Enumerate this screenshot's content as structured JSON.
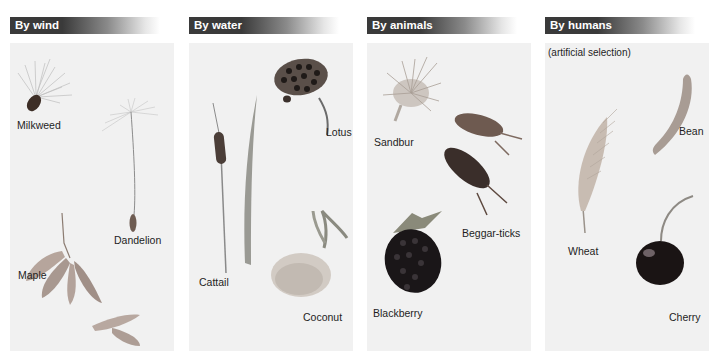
{
  "figure": {
    "panels": [
      {
        "title": "By wind",
        "subtitle": "",
        "examples": [
          {
            "name": "Milkweed",
            "icon": "milkweed-seed-icon"
          },
          {
            "name": "Dandelion",
            "icon": "dandelion-seed-icon"
          },
          {
            "name": "Maple",
            "icon": "maple-samara-icon"
          }
        ]
      },
      {
        "title": "By water",
        "subtitle": "",
        "examples": [
          {
            "name": "Lotus",
            "icon": "lotus-pod-icon"
          },
          {
            "name": "Cattail",
            "icon": "cattail-icon"
          },
          {
            "name": "Coconut",
            "icon": "coconut-icon"
          }
        ]
      },
      {
        "title": "By animals",
        "subtitle": "",
        "examples": [
          {
            "name": "Sandbur",
            "icon": "sandbur-icon"
          },
          {
            "name": "Beggar-ticks",
            "icon": "beggar-ticks-icon"
          },
          {
            "name": "Blackberry",
            "icon": "blackberry-icon"
          }
        ]
      },
      {
        "title": "By humans",
        "subtitle": "(artificial selection)",
        "examples": [
          {
            "name": "Bean",
            "icon": "bean-pod-icon"
          },
          {
            "name": "Wheat",
            "icon": "wheat-ear-icon"
          },
          {
            "name": "Cherry",
            "icon": "cherry-icon"
          }
        ]
      }
    ],
    "colors": {
      "header_dark": "#3a3a3a",
      "panel_bg": "#f1f1f1",
      "label_text": "#1e1e1e"
    }
  }
}
